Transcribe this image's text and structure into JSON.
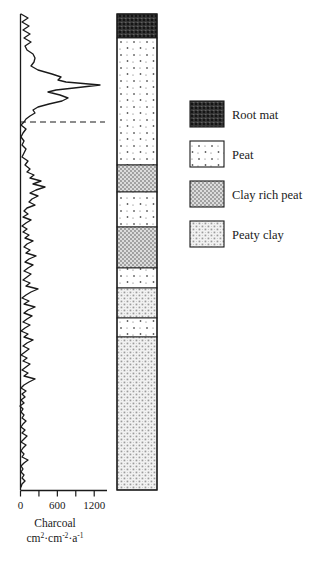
{
  "chart_data": {
    "type": "line",
    "title": "",
    "xlabel": "Charcoal",
    "xunits_line1": "cm",
    "xunits_sup1": "2",
    "xunits_mid": "·cm",
    "xunits_sup2": "-2",
    "xunits_mid2": "·a",
    "xunits_sup3": "-1",
    "xlabel_full": "Charcoal cm2·cm-2·a-1",
    "ylabel": "",
    "xlim": [
      0,
      1400
    ],
    "tick_values": [
      0,
      300,
      600,
      900,
      1200
    ],
    "tick_labels": [
      "0",
      "",
      "600",
      "",
      "1200"
    ],
    "grid": false,
    "legend_position": "right",
    "orientation": "depth-vertical",
    "axis_position": "bottom",
    "annotations": [
      {
        "name": "dashed-horizontal-marker",
        "y_px": 122,
        "x_start_px": 20,
        "x_end_px": 105,
        "style": "dashed"
      }
    ],
    "series": [
      {
        "name": "Charcoal influx",
        "values_px": [
          [
            21,
            14
          ],
          [
            28,
            18
          ],
          [
            22,
            22
          ],
          [
            29,
            26
          ],
          [
            23,
            30
          ],
          [
            30,
            34
          ],
          [
            24,
            38
          ],
          [
            31,
            42
          ],
          [
            25,
            46
          ],
          [
            27,
            50
          ],
          [
            33,
            54
          ],
          [
            35,
            58
          ],
          [
            34,
            62
          ],
          [
            31,
            66
          ],
          [
            38,
            70
          ],
          [
            52,
            74
          ],
          [
            61,
            77
          ],
          [
            58,
            80
          ],
          [
            66,
            82
          ],
          [
            100,
            85
          ],
          [
            74,
            88
          ],
          [
            56,
            90
          ],
          [
            48,
            92
          ],
          [
            60,
            95
          ],
          [
            68,
            98
          ],
          [
            62,
            101
          ],
          [
            49,
            104
          ],
          [
            38,
            107
          ],
          [
            33,
            110
          ],
          [
            35,
            113
          ],
          [
            30,
            116
          ],
          [
            26,
            119
          ],
          [
            24,
            122
          ],
          [
            21,
            125
          ],
          [
            26,
            129
          ],
          [
            23,
            133
          ],
          [
            21,
            137
          ],
          [
            24,
            141
          ],
          [
            22,
            145
          ],
          [
            26,
            149
          ],
          [
            24,
            153
          ],
          [
            22,
            157
          ],
          [
            28,
            161
          ],
          [
            25,
            165
          ],
          [
            30,
            169
          ],
          [
            27,
            172
          ],
          [
            34,
            175
          ],
          [
            30,
            178
          ],
          [
            41,
            181
          ],
          [
            33,
            184
          ],
          [
            45,
            187
          ],
          [
            36,
            190
          ],
          [
            30,
            193
          ],
          [
            38,
            196
          ],
          [
            32,
            199
          ],
          [
            29,
            202
          ],
          [
            35,
            205
          ],
          [
            27,
            208
          ],
          [
            24,
            211
          ],
          [
            28,
            214
          ],
          [
            23,
            217
          ],
          [
            31,
            220
          ],
          [
            26,
            223
          ],
          [
            22,
            226
          ],
          [
            27,
            229
          ],
          [
            23,
            232
          ],
          [
            29,
            235
          ],
          [
            25,
            238
          ],
          [
            33,
            241
          ],
          [
            27,
            244
          ],
          [
            24,
            247
          ],
          [
            30,
            250
          ],
          [
            26,
            253
          ],
          [
            36,
            256
          ],
          [
            29,
            259
          ],
          [
            25,
            262
          ],
          [
            33,
            265
          ],
          [
            28,
            268
          ],
          [
            24,
            271
          ],
          [
            31,
            274
          ],
          [
            27,
            277
          ],
          [
            23,
            280
          ],
          [
            30,
            283
          ],
          [
            26,
            286
          ],
          [
            38,
            289
          ],
          [
            31,
            292
          ],
          [
            26,
            295
          ],
          [
            22,
            298
          ],
          [
            29,
            301
          ],
          [
            24,
            304
          ],
          [
            35,
            307
          ],
          [
            28,
            310
          ],
          [
            24,
            313
          ],
          [
            32,
            316
          ],
          [
            27,
            319
          ],
          [
            23,
            322
          ],
          [
            30,
            325
          ],
          [
            25,
            328
          ],
          [
            21,
            331
          ],
          [
            28,
            334
          ],
          [
            24,
            337
          ],
          [
            33,
            340
          ],
          [
            27,
            343
          ],
          [
            23,
            346
          ],
          [
            29,
            349
          ],
          [
            25,
            352
          ],
          [
            21,
            355
          ],
          [
            27,
            358
          ],
          [
            23,
            361
          ],
          [
            30,
            364
          ],
          [
            26,
            367
          ],
          [
            22,
            370
          ],
          [
            28,
            373
          ],
          [
            24,
            376
          ],
          [
            35,
            379
          ],
          [
            29,
            382
          ],
          [
            24,
            385
          ],
          [
            21,
            388
          ],
          [
            26,
            391
          ],
          [
            22,
            394
          ],
          [
            25,
            397
          ],
          [
            21,
            400
          ],
          [
            24,
            403
          ],
          [
            20,
            406
          ],
          [
            23,
            409
          ],
          [
            21,
            412
          ],
          [
            24,
            415
          ],
          [
            22,
            418
          ],
          [
            26,
            421
          ],
          [
            23,
            424
          ],
          [
            21,
            427
          ],
          [
            25,
            430
          ],
          [
            22,
            433
          ],
          [
            27,
            436
          ],
          [
            24,
            439
          ],
          [
            21,
            442
          ],
          [
            26,
            445
          ],
          [
            23,
            448
          ],
          [
            21,
            451
          ],
          [
            24,
            454
          ],
          [
            22,
            457
          ],
          [
            28,
            460
          ],
          [
            24,
            463
          ],
          [
            21,
            466
          ],
          [
            23,
            469
          ],
          [
            21,
            472
          ],
          [
            24,
            475
          ],
          [
            22,
            478
          ],
          [
            25,
            481
          ],
          [
            22,
            484
          ],
          [
            21,
            487
          ]
        ]
      }
    ]
  },
  "lithology": {
    "name": "Stratigraphic column",
    "x_px": 117,
    "width_px": 40,
    "top_px": 14,
    "bottom_px": 490,
    "segments": [
      {
        "facies": "root-mat",
        "top_px": 14,
        "bottom_px": 38
      },
      {
        "facies": "peat",
        "top_px": 38,
        "bottom_px": 165
      },
      {
        "facies": "clay-rich-peat",
        "top_px": 165,
        "bottom_px": 192
      },
      {
        "facies": "peat",
        "top_px": 192,
        "bottom_px": 227
      },
      {
        "facies": "clay-rich-peat",
        "top_px": 227,
        "bottom_px": 268
      },
      {
        "facies": "peat",
        "top_px": 268,
        "bottom_px": 288
      },
      {
        "facies": "peaty-clay",
        "top_px": 288,
        "bottom_px": 318
      },
      {
        "facies": "peat",
        "top_px": 318,
        "bottom_px": 337
      },
      {
        "facies": "peaty-clay",
        "top_px": 337,
        "bottom_px": 490
      }
    ]
  },
  "legend": {
    "items": [
      {
        "facies": "root-mat",
        "label": "Root mat",
        "swatch_y_px": 101
      },
      {
        "facies": "peat",
        "label": "Peat",
        "swatch_y_px": 141
      },
      {
        "facies": "clay-rich-peat",
        "label": "Clay rich peat",
        "swatch_y_px": 181
      },
      {
        "facies": "peaty-clay",
        "label": "Peaty clay",
        "swatch_y_px": 221
      }
    ],
    "swatch_x_px": 190,
    "swatch_w_px": 34,
    "swatch_h_px": 26,
    "label_x_px": 232
  },
  "colors": {
    "line": "#1a1a1a",
    "axis": "#1a1a1a",
    "background": "#ffffff",
    "root_mat_fill": "#3c3c3c",
    "peat_fill": "#ffffff",
    "clay_rich_peat_fill": "#d8d8d8",
    "peaty_clay_fill": "#efefef",
    "dash": "#1a1a1a"
  }
}
